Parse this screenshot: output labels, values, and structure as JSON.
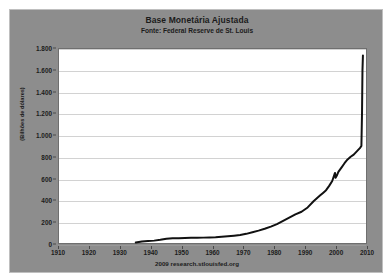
{
  "chart_data": {
    "type": "line",
    "title": "Base Monetária Ajustada",
    "subtitle": "Fonte: Federal Reserve de St. Louis",
    "xlabel": "",
    "ylabel": "(Bilhões de dólares)",
    "footer": "2009 research.stlouisfed.org",
    "grid": true,
    "legend": "none",
    "xlim": [
      1910,
      2010
    ],
    "ylim": [
      0,
      1800
    ],
    "x_ticks": [
      1910,
      1920,
      1930,
      1940,
      1950,
      1960,
      1970,
      1980,
      1990,
      2000,
      2010
    ],
    "x_tick_labels": [
      "1910",
      "1920",
      "1930",
      "1940",
      "1950",
      "1960",
      "1970",
      "1980",
      "1990",
      "2000",
      "2010"
    ],
    "y_ticks": [
      0,
      200,
      400,
      600,
      800,
      1000,
      1200,
      1400,
      1600,
      1800
    ],
    "y_tick_labels": [
      "0",
      "200",
      "400",
      "600",
      "800",
      "1.000",
      "1.200",
      "1.400",
      "1.600",
      "1.800"
    ],
    "series": [
      {
        "name": "Base Monetária Ajustada",
        "color": "#111111",
        "x": [
          1935,
          1937,
          1939,
          1941,
          1943,
          1945,
          1947,
          1949,
          1951,
          1953,
          1955,
          1957,
          1959,
          1961,
          1963,
          1965,
          1967,
          1969,
          1971,
          1973,
          1975,
          1977,
          1979,
          1981,
          1983,
          1985,
          1987,
          1989,
          1991,
          1993,
          1995,
          1996,
          1997,
          1998,
          1999,
          1999.9,
          2000.1,
          2000.5,
          2001,
          2002,
          2003,
          2004,
          2005,
          2006,
          2007,
          2008,
          2008.5,
          2008.7,
          2008.85,
          2009
        ],
        "y": [
          5,
          14,
          18,
          22,
          30,
          40,
          45,
          45,
          47,
          48,
          49,
          50,
          51,
          53,
          57,
          62,
          68,
          75,
          85,
          100,
          115,
          132,
          152,
          175,
          205,
          235,
          265,
          290,
          330,
          390,
          440,
          465,
          490,
          530,
          575,
          650,
          605,
          625,
          660,
          700,
          740,
          775,
          800,
          820,
          850,
          880,
          900,
          1200,
          1600,
          1740
        ]
      }
    ]
  },
  "colors": {
    "panel_background": "#8d8d8d",
    "plot_background": "#ffffff",
    "gridline": "#d2d2d2",
    "line": "#111111",
    "text": "#1b1b1b"
  }
}
